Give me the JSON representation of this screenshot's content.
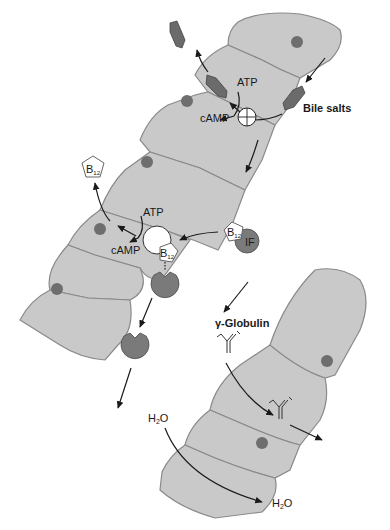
{
  "diagram": {
    "labels": {
      "atp_top": "ATP",
      "camp_top": "cAMP",
      "bile_salts": "Bile salts",
      "atp_mid": "ATP",
      "camp_mid": "cAMP",
      "b12_free": "B",
      "b12_sub": "12",
      "b12_bound": "B",
      "b12_bound_sub": "12",
      "b12_if": "B",
      "b12_if_sub": "12",
      "intrinsic_factor": "IF",
      "gamma_globulin": "γ-Globulin",
      "h2o_in": "H",
      "h2o_in_sub": "2",
      "h2o_in_o": "O",
      "h2o_out": "H",
      "h2o_out_sub": "2",
      "h2o_out_o": "O"
    },
    "colors": {
      "cell_fill": "#c9c9c9",
      "cell_stroke": "#8a8a8a",
      "nucleus": "#6e6e6e",
      "bile_salt": "#6b6b6b",
      "receptor": "#7a7a7a",
      "arrow": "#1a1a1a"
    },
    "epithelium_sheets": [
      {
        "name": "upper-left-sheet",
        "cell_count": 6
      },
      {
        "name": "lower-right-sheet",
        "cell_count": 4
      }
    ]
  }
}
